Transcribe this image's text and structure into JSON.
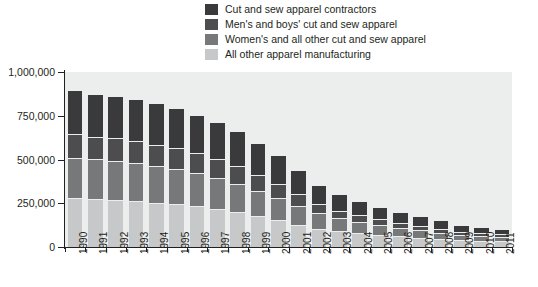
{
  "chart_data": {
    "type": "bar",
    "stacked": true,
    "title": "",
    "xlabel": "",
    "ylabel": "",
    "ylim": [
      0,
      1000000
    ],
    "ytick_labels": [
      "1,000,000",
      "750,000",
      "500,000",
      "250,000",
      "0"
    ],
    "ytick_values": [
      1000000,
      750000,
      500000,
      250000,
      0
    ],
    "grid": false,
    "legend_position": "top-center",
    "categories": [
      "1990",
      "1991",
      "1992",
      "1993",
      "1994",
      "1995",
      "1996",
      "1997",
      "1998",
      "1999",
      "2000",
      "2001",
      "2002",
      "2003",
      "2004",
      "2005",
      "2006",
      "2007",
      "2008",
      "2009",
      "2010",
      "2011"
    ],
    "series": [
      {
        "name": "Cut and sew apparel contractors",
        "color": "#3a3a3c",
        "values": [
          250000,
          245000,
          245000,
          240000,
          235000,
          230000,
          220000,
          215000,
          205000,
          185000,
          165000,
          140000,
          110000,
          92000,
          80000,
          72000,
          62000,
          55000,
          48000,
          38000,
          35000,
          33000
        ]
      },
      {
        "name": "Men's and boys' cut and sew apparel",
        "color": "#4d4d50",
        "values": [
          135000,
          130000,
          128000,
          125000,
          122000,
          118000,
          112000,
          105000,
          98000,
          88000,
          78000,
          65000,
          52000,
          44000,
          38000,
          33000,
          28000,
          25000,
          22000,
          18000,
          16000,
          15000
        ]
      },
      {
        "name": "Women's and all other cut and sew apparel",
        "color": "#76787a",
        "values": [
          230000,
          228000,
          225000,
          218000,
          210000,
          202000,
          192000,
          180000,
          165000,
          148000,
          130000,
          108000,
          88000,
          74000,
          64000,
          56000,
          48000,
          42000,
          36000,
          29000,
          26000,
          24000
        ]
      },
      {
        "name": "All other apparel manufacturing",
        "color": "#c6c8c9",
        "values": [
          275000,
          267000,
          262000,
          257000,
          248000,
          240000,
          226000,
          210000,
          192000,
          169000,
          147000,
          122000,
          100000,
          85000,
          73000,
          64000,
          57000,
          48000,
          41000,
          33000,
          30000,
          28000
        ]
      }
    ],
    "totals": [
      890000,
      870000,
      860000,
      840000,
      815000,
      790000,
      750000,
      710000,
      660000,
      590000,
      520000,
      435000,
      350000,
      295000,
      255000,
      225000,
      195000,
      170000,
      147000,
      118000,
      107000,
      100000
    ]
  },
  "legend": {
    "items": [
      {
        "label": "Cut and sew apparel contractors",
        "color": "#3a3a3c"
      },
      {
        "label": "Men's and boys' cut and sew apparel",
        "color": "#4d4d50"
      },
      {
        "label": "Women's and all other cut and sew apparel",
        "color": "#76787a"
      },
      {
        "label": "All other apparel manufacturing",
        "color": "#c6c8c9"
      }
    ]
  }
}
